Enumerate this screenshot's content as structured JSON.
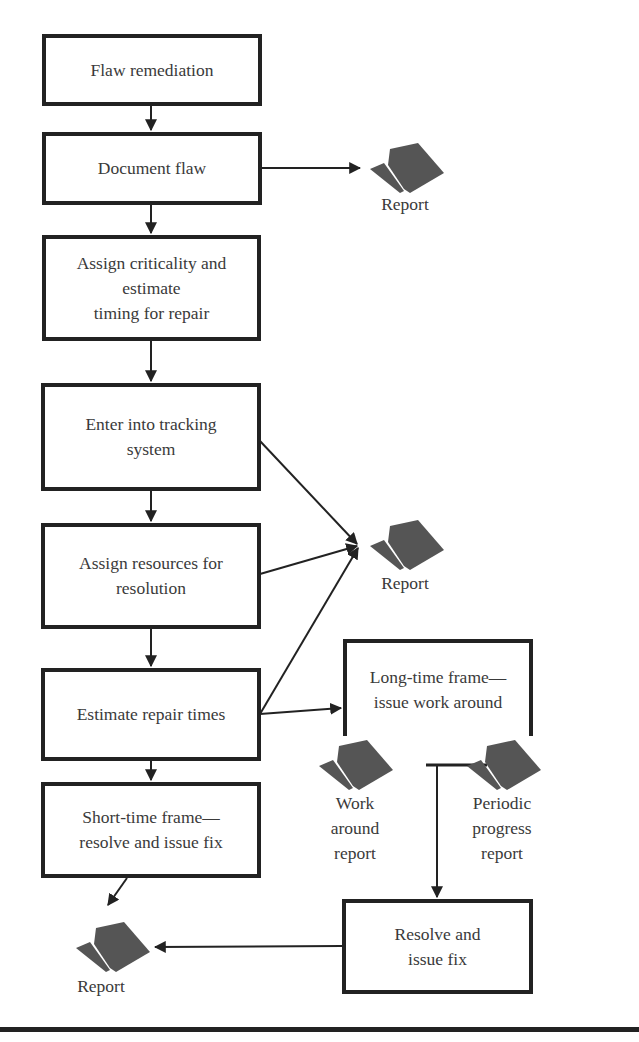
{
  "diagram": {
    "type": "flowchart",
    "nodes": [
      {
        "id": "flaw_remediation",
        "label": "Flaw remediation"
      },
      {
        "id": "document_flaw",
        "label": "Document flaw"
      },
      {
        "id": "assign_criticality",
        "label": "Assign criticality and\nestimate\ntiming for repair"
      },
      {
        "id": "enter_tracking",
        "label": "Enter into tracking\nsystem"
      },
      {
        "id": "assign_resources",
        "label": "Assign resources for\nresolution"
      },
      {
        "id": "estimate_repair",
        "label": "Estimate repair times"
      },
      {
        "id": "short_time",
        "label": "Short-time frame—\nresolve and issue fix"
      },
      {
        "id": "long_time",
        "label": "Long-time frame—\nissue work around"
      },
      {
        "id": "resolve_issue",
        "label": "Resolve and\nissue fix"
      }
    ],
    "reports": [
      {
        "id": "report_1",
        "label": "Report"
      },
      {
        "id": "report_2",
        "label": "Report"
      },
      {
        "id": "work_around_report",
        "label": "Work\naround\nreport"
      },
      {
        "id": "periodic_progress_report",
        "label": "Periodic\nprogress\nreport"
      },
      {
        "id": "report_3",
        "label": "Report"
      }
    ],
    "edges": [
      {
        "from": "flaw_remediation",
        "to": "document_flaw"
      },
      {
        "from": "document_flaw",
        "to": "report_1"
      },
      {
        "from": "document_flaw",
        "to": "assign_criticality"
      },
      {
        "from": "assign_criticality",
        "to": "enter_tracking"
      },
      {
        "from": "enter_tracking",
        "to": "assign_resources"
      },
      {
        "from": "enter_tracking",
        "to": "report_2"
      },
      {
        "from": "assign_resources",
        "to": "report_2"
      },
      {
        "from": "assign_resources",
        "to": "estimate_repair"
      },
      {
        "from": "estimate_repair",
        "to": "report_2"
      },
      {
        "from": "estimate_repair",
        "to": "long_time"
      },
      {
        "from": "estimate_repair",
        "to": "short_time"
      },
      {
        "from": "short_time",
        "to": "report_3"
      },
      {
        "from": "work_around_report",
        "to": "resolve_issue"
      },
      {
        "from": "periodic_progress_report",
        "to": "resolve_issue"
      },
      {
        "from": "resolve_issue",
        "to": "report_3"
      }
    ],
    "colors": {
      "stroke": "#222222",
      "text": "#3a3a3a",
      "icon": "#555555",
      "background": "#ffffff"
    }
  }
}
